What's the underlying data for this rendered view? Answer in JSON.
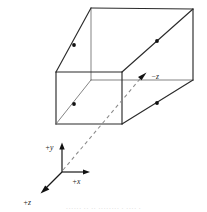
{
  "figure": {
    "type": "technical-line-diagram",
    "background_color": "#ffffff",
    "line_color": "#2b2b2b",
    "thin_line_color": "#6e6e6e",
    "dashed_line_color": "#8a8a8a",
    "marker_color": "#111111"
  },
  "labels": {
    "neg_z": "−z",
    "pos_y": "+y",
    "pos_x": "+x",
    "pos_z": "+z"
  },
  "axes": {
    "origin": {
      "x": 62,
      "y": 172
    },
    "items": [
      {
        "name": "pos_y",
        "label": "+y",
        "dx": 0,
        "dy": -28,
        "label_x": 43,
        "label_y": 148
      },
      {
        "name": "pos_x",
        "label": "+x",
        "dx": 28,
        "dy": 0,
        "label_x": 70,
        "label_y": 186
      },
      {
        "name": "pos_z",
        "label": "+z",
        "dx": -22,
        "dy": 22,
        "label_x": 20,
        "label_y": 203
      }
    ]
  },
  "box": {
    "front_face": {
      "left": 56,
      "top": 72,
      "right": 122,
      "bottom": 124
    },
    "back_face": {
      "left": 91,
      "top": 8,
      "right": 193,
      "bottom": 80
    },
    "depth_markers": 4
  },
  "view_ray": {
    "from": {
      "x": 62,
      "y": 172
    },
    "to": {
      "x": 146,
      "y": 76
    },
    "style": "dashed",
    "arrow_label": "−z"
  },
  "markers": [
    {
      "name": "edge-marker-top-left",
      "x": 74,
      "y": 45
    },
    {
      "name": "edge-marker-top-right",
      "x": 157,
      "y": 44
    },
    {
      "name": "edge-marker-bottom-left",
      "x": 74,
      "y": 106
    },
    {
      "name": "edge-marker-bottom-right",
      "x": 157,
      "y": 105
    }
  ],
  "caption": {
    "text": "······   ·· ·· ········ · ···· ·"
  }
}
